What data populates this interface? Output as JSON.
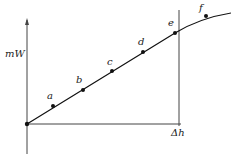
{
  "diagram": {
    "y_axis_label": "mW",
    "x_axis_label": "Δh",
    "points": [
      {
        "label": "a",
        "x": 53,
        "y": 106
      },
      {
        "label": "b",
        "x": 83,
        "y": 90
      },
      {
        "label": "c",
        "x": 112,
        "y": 71
      },
      {
        "label": "d",
        "x": 143,
        "y": 52
      },
      {
        "label": "e",
        "x": 175,
        "y": 33
      },
      {
        "label": "f",
        "x": 206,
        "y": 16
      }
    ],
    "origin": {
      "x": 27,
      "y": 124
    }
  }
}
